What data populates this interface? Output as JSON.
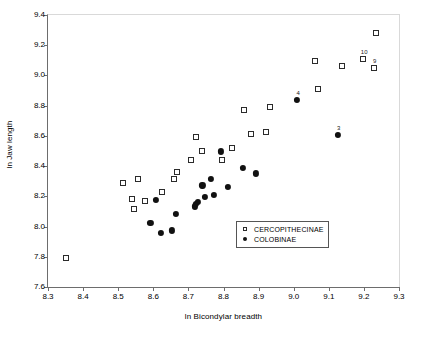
{
  "chart_data": {
    "type": "scatter",
    "title": "",
    "xlabel": "ln Bicondylar breadth",
    "ylabel": "ln Jaw length",
    "xlim": [
      8.3,
      9.3
    ],
    "ylim": [
      7.6,
      9.4
    ],
    "xticks": [
      "8.3",
      "8.4",
      "8.5",
      "8.6",
      "8.7",
      "8.8",
      "8.9",
      "9.0",
      "9.1",
      "9.2",
      "9.3"
    ],
    "yticks": [
      "7.6",
      "7.8",
      "8.0",
      "8.2",
      "8.4",
      "8.6",
      "8.8",
      "9.0",
      "9.2",
      "9.4"
    ],
    "grid": false,
    "legend_position": "lower-right",
    "series": [
      {
        "name": "CERCOPITHECINAE",
        "marker": "open-square",
        "color": "#2b2b2b",
        "points": [
          {
            "x": 8.35,
            "y": 7.79,
            "label": ""
          },
          {
            "x": 8.515,
            "y": 8.29,
            "label": ""
          },
          {
            "x": 8.54,
            "y": 8.185,
            "label": ""
          },
          {
            "x": 8.545,
            "y": 8.115,
            "label": ""
          },
          {
            "x": 8.555,
            "y": 8.312,
            "label": ""
          },
          {
            "x": 8.575,
            "y": 8.168,
            "label": ""
          },
          {
            "x": 8.625,
            "y": 8.23,
            "label": ""
          },
          {
            "x": 8.66,
            "y": 8.312,
            "label": ""
          },
          {
            "x": 8.668,
            "y": 8.358,
            "label": ""
          },
          {
            "x": 8.707,
            "y": 8.442,
            "label": ""
          },
          {
            "x": 8.723,
            "y": 8.592,
            "label": ""
          },
          {
            "x": 8.74,
            "y": 8.498,
            "label": ""
          },
          {
            "x": 8.795,
            "y": 8.442,
            "label": ""
          },
          {
            "x": 8.825,
            "y": 8.522,
            "label": ""
          },
          {
            "x": 8.858,
            "y": 8.773,
            "label": ""
          },
          {
            "x": 8.878,
            "y": 8.61,
            "label": ""
          },
          {
            "x": 8.92,
            "y": 8.625,
            "label": ""
          },
          {
            "x": 8.932,
            "y": 8.793,
            "label": ""
          },
          {
            "x": 9.062,
            "y": 9.095,
            "label": ""
          },
          {
            "x": 9.068,
            "y": 8.908,
            "label": ""
          },
          {
            "x": 9.138,
            "y": 9.062,
            "label": ""
          },
          {
            "x": 9.198,
            "y": 9.11,
            "label": "10"
          },
          {
            "x": 9.228,
            "y": 9.052,
            "label": "9"
          },
          {
            "x": 9.235,
            "y": 9.282,
            "label": ""
          }
        ]
      },
      {
        "name": "COLOBINAE",
        "marker": "filled-circle",
        "color": "#111111",
        "points": [
          {
            "x": 8.592,
            "y": 8.022,
            "label": ""
          },
          {
            "x": 8.608,
            "y": 8.178,
            "label": ""
          },
          {
            "x": 8.622,
            "y": 7.958,
            "label": ""
          },
          {
            "x": 8.652,
            "y": 7.975,
            "label": ""
          },
          {
            "x": 8.665,
            "y": 8.085,
            "label": ""
          },
          {
            "x": 8.718,
            "y": 8.133,
            "label": ""
          },
          {
            "x": 8.722,
            "y": 8.148,
            "label": ""
          },
          {
            "x": 8.728,
            "y": 8.165,
            "label": ""
          },
          {
            "x": 8.74,
            "y": 8.272,
            "label": ""
          },
          {
            "x": 8.748,
            "y": 8.197,
            "label": ""
          },
          {
            "x": 8.765,
            "y": 8.318,
            "label": ""
          },
          {
            "x": 8.772,
            "y": 8.21,
            "label": ""
          },
          {
            "x": 8.792,
            "y": 8.497,
            "label": ""
          },
          {
            "x": 8.812,
            "y": 8.265,
            "label": ""
          },
          {
            "x": 8.855,
            "y": 8.388,
            "label": ""
          },
          {
            "x": 8.893,
            "y": 8.352,
            "label": ""
          },
          {
            "x": 9.01,
            "y": 8.84,
            "label": "4"
          },
          {
            "x": 9.125,
            "y": 8.608,
            "label": "3"
          }
        ]
      }
    ]
  },
  "legend": {
    "entries": [
      {
        "key": "open-square",
        "label": "CERCOPITHECINAE"
      },
      {
        "key": "filled-circle",
        "label": "COLOBINAE"
      }
    ]
  }
}
